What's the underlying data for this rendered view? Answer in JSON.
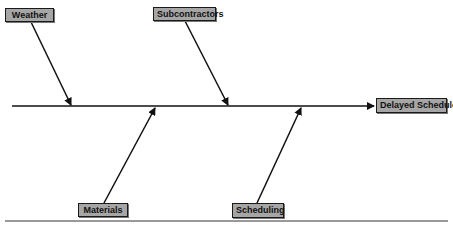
{
  "diagram": {
    "type": "fishbone",
    "effect": {
      "label": "Delayed Schedule"
    },
    "causes": [
      {
        "label": "Weather",
        "position": "top"
      },
      {
        "label": "Subcontractors",
        "position": "top"
      },
      {
        "label": "Materials",
        "position": "bottom"
      },
      {
        "label": "Scheduling",
        "position": "bottom"
      }
    ],
    "colors": {
      "box_fill": "#a6a6a6",
      "box_border": "#1a1a1a",
      "line": "#111111",
      "separator": "#999999"
    }
  }
}
